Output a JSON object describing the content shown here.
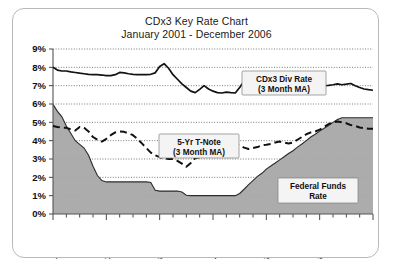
{
  "chart_data": {
    "type": "line",
    "title": "CDx3 Key Rate Chart",
    "subtitle": "January 2001 - December 2006",
    "xlabel": "",
    "ylabel": "",
    "ylim": [
      0,
      9
    ],
    "y_tick_labels": [
      "0%",
      "1%",
      "2%",
      "3%",
      "4%",
      "5%",
      "6%",
      "7%",
      "8%",
      "9%"
    ],
    "y_tick_values": [
      0,
      1,
      2,
      3,
      4,
      5,
      6,
      7,
      8,
      9
    ],
    "x_tick_labels": [
      "2001",
      "2002",
      "2003",
      "2004",
      "2005",
      "2006"
    ],
    "x_tick_values": [
      2001,
      2002,
      2003,
      2004,
      2005,
      2006
    ],
    "xlim": [
      2001,
      2007
    ],
    "grid": true,
    "legend_position": "inline-annotations",
    "annotations": [
      {
        "name": "cdx3-div-rate-label",
        "line1": "CDx3 Div Rate",
        "line2": "(3 Month MA)"
      },
      {
        "name": "five-yr-tnote-label",
        "line1": "5-Yr T-Note",
        "line2": "(3 Month MA)"
      },
      {
        "name": "federal-funds-rate-label",
        "line1": "Federal Funds",
        "line2": "Rate"
      }
    ],
    "series": [
      {
        "name": "CDx3 Div Rate (3 Month MA)",
        "style": "solid",
        "color": "#111111",
        "x": [
          2001.0,
          2001.083,
          2001.167,
          2001.25,
          2001.333,
          2001.417,
          2001.5,
          2001.583,
          2001.667,
          2001.75,
          2001.833,
          2001.917,
          2002.0,
          2002.083,
          2002.167,
          2002.25,
          2002.333,
          2002.417,
          2002.5,
          2002.583,
          2002.667,
          2002.75,
          2002.833,
          2002.917,
          2003.0,
          2003.083,
          2003.167,
          2003.25,
          2003.333,
          2003.417,
          2003.5,
          2003.583,
          2003.667,
          2003.75,
          2003.833,
          2003.917,
          2004.0,
          2004.083,
          2004.167,
          2004.25,
          2004.333,
          2004.417,
          2004.5,
          2004.583,
          2004.667,
          2004.75,
          2004.833,
          2004.917,
          2005.0,
          2005.083,
          2005.167,
          2005.25,
          2005.333,
          2005.417,
          2005.5,
          2005.583,
          2005.667,
          2005.75,
          2005.833,
          2005.917,
          2006.0,
          2006.083,
          2006.167,
          2006.25,
          2006.333,
          2006.417,
          2006.5,
          2006.583,
          2006.667,
          2006.75,
          2006.833,
          2006.917,
          2007.0
        ],
        "y": [
          8.0,
          7.85,
          7.8,
          7.8,
          7.75,
          7.72,
          7.68,
          7.65,
          7.62,
          7.6,
          7.6,
          7.58,
          7.55,
          7.55,
          7.6,
          7.72,
          7.7,
          7.65,
          7.62,
          7.6,
          7.6,
          7.6,
          7.62,
          7.7,
          8.05,
          8.2,
          7.95,
          7.6,
          7.35,
          7.1,
          6.9,
          6.7,
          6.62,
          6.8,
          7.0,
          6.82,
          6.7,
          6.62,
          6.6,
          6.65,
          6.62,
          6.6,
          6.9,
          7.25,
          7.0,
          6.85,
          6.78,
          6.72,
          6.68,
          6.65,
          6.68,
          6.72,
          6.8,
          6.9,
          6.85,
          6.78,
          6.88,
          6.82,
          6.85,
          6.92,
          6.95,
          7.0,
          7.02,
          7.05,
          7.1,
          7.05,
          7.08,
          7.12,
          7.0,
          6.9,
          6.82,
          6.78,
          6.75
        ]
      },
      {
        "name": "5-Yr T-Note (3 Month MA)",
        "style": "dashed",
        "color": "#111111",
        "x": [
          2001.0,
          2001.083,
          2001.167,
          2001.25,
          2001.333,
          2001.417,
          2001.5,
          2001.583,
          2001.667,
          2001.75,
          2001.833,
          2001.917,
          2002.0,
          2002.083,
          2002.167,
          2002.25,
          2002.333,
          2002.417,
          2002.5,
          2002.583,
          2002.667,
          2002.75,
          2002.833,
          2002.917,
          2003.0,
          2003.083,
          2003.167,
          2003.25,
          2003.333,
          2003.417,
          2003.5,
          2003.583,
          2003.667,
          2003.75,
          2003.833,
          2003.917,
          2004.0,
          2004.083,
          2004.167,
          2004.25,
          2004.333,
          2004.417,
          2004.5,
          2004.583,
          2004.667,
          2004.75,
          2004.833,
          2004.917,
          2005.0,
          2005.083,
          2005.167,
          2005.25,
          2005.333,
          2005.417,
          2005.5,
          2005.583,
          2005.667,
          2005.75,
          2005.833,
          2005.917,
          2006.0,
          2006.083,
          2006.167,
          2006.25,
          2006.333,
          2006.417,
          2006.5,
          2006.583,
          2006.667,
          2006.75,
          2006.833,
          2006.917,
          2007.0
        ],
        "y": [
          4.8,
          4.75,
          4.72,
          4.7,
          4.62,
          4.55,
          4.75,
          4.7,
          4.5,
          4.2,
          4.05,
          3.95,
          4.1,
          4.3,
          4.45,
          4.5,
          4.48,
          4.4,
          4.3,
          4.1,
          3.85,
          3.6,
          3.35,
          3.2,
          3.1,
          3.05,
          3.0,
          3.0,
          2.9,
          2.75,
          2.58,
          2.78,
          3.05,
          3.1,
          3.15,
          3.15,
          3.15,
          3.15,
          3.2,
          3.45,
          3.75,
          3.82,
          3.75,
          3.62,
          3.55,
          3.6,
          3.65,
          3.75,
          3.78,
          3.82,
          3.9,
          3.95,
          3.9,
          3.85,
          3.9,
          4.05,
          4.2,
          4.35,
          4.45,
          4.5,
          4.6,
          4.75,
          4.9,
          5.0,
          5.05,
          5.0,
          4.95,
          4.85,
          4.8,
          4.72,
          4.68,
          4.65,
          4.65
        ]
      },
      {
        "name": "Federal Funds Rate",
        "style": "area",
        "color": "#a8a8a8",
        "x": [
          2001.0,
          2001.083,
          2001.167,
          2001.25,
          2001.333,
          2001.417,
          2001.5,
          2001.583,
          2001.667,
          2001.75,
          2001.833,
          2001.917,
          2002.0,
          2002.083,
          2002.167,
          2002.25,
          2002.333,
          2002.417,
          2002.5,
          2002.583,
          2002.667,
          2002.75,
          2002.833,
          2002.917,
          2003.0,
          2003.083,
          2003.167,
          2003.25,
          2003.333,
          2003.417,
          2003.5,
          2003.583,
          2003.667,
          2003.75,
          2003.833,
          2003.917,
          2004.0,
          2004.083,
          2004.167,
          2004.25,
          2004.333,
          2004.417,
          2004.5,
          2004.583,
          2004.667,
          2004.75,
          2004.833,
          2004.917,
          2005.0,
          2005.083,
          2005.167,
          2005.25,
          2005.333,
          2005.417,
          2005.5,
          2005.583,
          2005.667,
          2005.75,
          2005.833,
          2005.917,
          2006.0,
          2006.083,
          2006.167,
          2006.25,
          2006.333,
          2006.417,
          2006.5,
          2006.583,
          2006.667,
          2006.75,
          2006.833,
          2006.917,
          2007.0
        ],
        "y": [
          5.98,
          5.6,
          5.3,
          4.8,
          4.4,
          4.0,
          3.8,
          3.6,
          3.2,
          2.6,
          2.1,
          1.82,
          1.75,
          1.75,
          1.75,
          1.75,
          1.75,
          1.75,
          1.75,
          1.75,
          1.75,
          1.75,
          1.72,
          1.3,
          1.25,
          1.25,
          1.25,
          1.25,
          1.25,
          1.2,
          1.02,
          1.0,
          1.0,
          1.0,
          1.0,
          1.0,
          1.0,
          1.0,
          1.0,
          1.0,
          1.0,
          1.0,
          1.12,
          1.35,
          1.6,
          1.82,
          2.05,
          2.22,
          2.45,
          2.62,
          2.78,
          2.95,
          3.12,
          3.3,
          3.45,
          3.65,
          3.82,
          4.0,
          4.2,
          4.35,
          4.52,
          4.68,
          4.82,
          5.0,
          5.15,
          5.25,
          5.25,
          5.25,
          5.25,
          5.25,
          5.25,
          5.25,
          5.25
        ]
      }
    ]
  }
}
